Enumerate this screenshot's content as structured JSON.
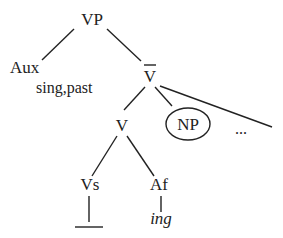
{
  "diagram": {
    "type": "syntax-tree",
    "nodes": {
      "vp": {
        "label": "VP"
      },
      "aux": {
        "label": "Aux",
        "features": "sing,past"
      },
      "vbar": {
        "label": "V"
      },
      "v": {
        "label": "V"
      },
      "np": {
        "label": "NP",
        "circled": true
      },
      "ellipsis": {
        "label": "..."
      },
      "vs": {
        "label": "Vs"
      },
      "af": {
        "label": "Af"
      },
      "ing": {
        "label": "ing"
      },
      "gap": {
        "label": ""
      }
    },
    "edges": [
      [
        "VP",
        "Aux"
      ],
      [
        "VP",
        "V-bar"
      ],
      [
        "V-bar",
        "V"
      ],
      [
        "V-bar",
        "NP"
      ],
      [
        "V-bar",
        "..."
      ],
      [
        "V",
        "Vs"
      ],
      [
        "V",
        "Af"
      ],
      [
        "Vs",
        "blank"
      ],
      [
        "Af",
        "ing"
      ]
    ]
  }
}
